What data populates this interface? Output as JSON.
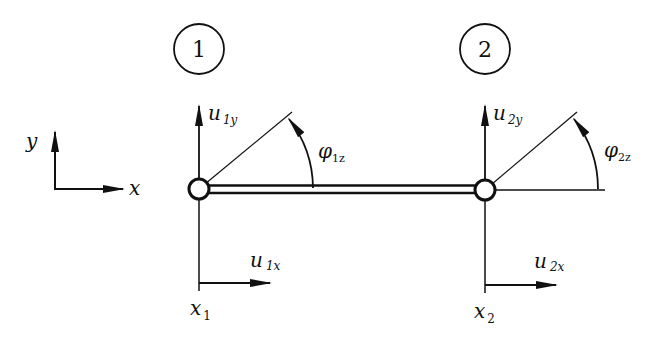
{
  "diagram": {
    "type": "beam-element-degrees-of-freedom",
    "colors": {
      "stroke": "#111111",
      "background": "#ffffff"
    },
    "global_axes": {
      "x_label": "x",
      "y_label": "y"
    },
    "nodes": [
      {
        "id": "1",
        "number_label": "1",
        "position_label_main": "x",
        "position_label_sub": "1",
        "dof_ux_main": "u",
        "dof_ux_sub": "1x",
        "dof_uy_main": "u",
        "dof_uy_sub": "1y",
        "rotation_main": "φ",
        "rotation_sub": "1z"
      },
      {
        "id": "2",
        "number_label": "2",
        "position_label_main": "x",
        "position_label_sub": "2",
        "dof_ux_main": "u",
        "dof_ux_sub": "2x",
        "dof_uy_main": "u",
        "dof_uy_sub": "2y",
        "rotation_main": "φ",
        "rotation_sub": "2z"
      }
    ]
  }
}
